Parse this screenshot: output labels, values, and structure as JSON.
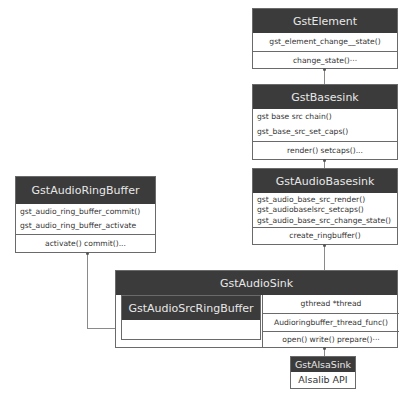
{
  "diagram": {
    "type": "class-hierarchy",
    "classes": {
      "gst_element": {
        "name": "GstElement",
        "functions": [
          "gst_element_change__state()"
        ],
        "vmethods": "change_state()···"
      },
      "gst_basesink": {
        "name": "GstBasesink",
        "functions": [
          "gst base src chain()",
          "gst_base_src_set_caps()"
        ],
        "vmethods": "render() setcaps()..."
      },
      "gst_audio_basesink": {
        "name": "GstAudioBasesink",
        "functions": [
          "gst_audio_base_src_render()",
          "gst_audiobaselsrc_setcaps()",
          "gst_audio_base_src_change_state()"
        ],
        "vmethods": "create_ringbuffer()"
      },
      "gst_audio_ring_buffer": {
        "name": "GstAudioRingBuffer",
        "functions": [
          "gst_audio_ring_buffer_commit()",
          "gst_audio_ring_buffer_activate"
        ],
        "vmethods": "activate() commit()..."
      },
      "gst_audio_sink": {
        "name": "GstAudioSink",
        "inner_class": "GstAudioSrcRingBuffer",
        "members": [
          "gthread *thread",
          "Audioringbuffer_thread_func()"
        ],
        "vmethods": "open() write() prepare()···"
      },
      "gst_alsa_sink": {
        "name": "GstAlsaSink",
        "api": "Alsalib API"
      }
    },
    "edges": [
      {
        "from": "GstBasesink",
        "to": "GstElement",
        "kind": "inherits"
      },
      {
        "from": "GstAudioBasesink",
        "to": "GstBasesink",
        "kind": "inherits"
      },
      {
        "from": "GstAudioSink",
        "to": "GstAudioBasesink",
        "kind": "inherits"
      },
      {
        "from": "GstAlsaSink",
        "to": "GstAudioSink",
        "kind": "inherits"
      },
      {
        "from": "GstAudioSrcRingBuffer",
        "to": "GstAudioRingBuffer",
        "kind": "inherits"
      }
    ]
  }
}
